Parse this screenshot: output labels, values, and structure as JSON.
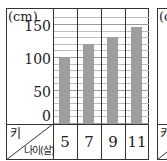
{
  "chart_data": {
    "type": "bar",
    "title": "",
    "xlabel": "나이(살)",
    "ylabel": "키",
    "unit": "(cm)",
    "categories": [
      "5",
      "7",
      "9",
      "11"
    ],
    "values": [
      100,
      120,
      130,
      145
    ],
    "ylim": [
      0,
      150
    ],
    "yticks": [
      "150",
      "100",
      "50",
      "0"
    ],
    "grid": true,
    "minor_grid_step": 10,
    "legend": null,
    "bar_color": "#9e9e9e"
  },
  "table": {
    "row_header_top": "키",
    "row_header_bottom": "나이(살)"
  },
  "second_panel": {
    "partial_unit": "(c",
    "partial_header": "키"
  }
}
